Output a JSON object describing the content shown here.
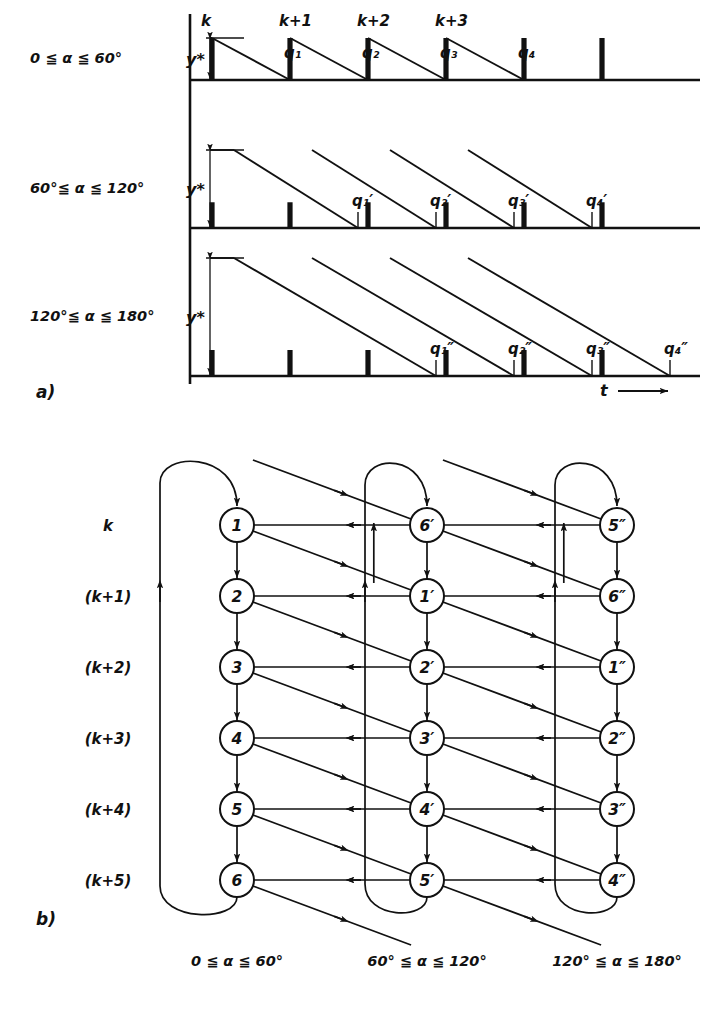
{
  "figure": {
    "panel_a_tag": "a)",
    "panel_b_tag": "b)",
    "time_axis_label": "t"
  },
  "panel_a": {
    "rows": [
      {
        "range_label": "0 ≦ α ≦ 60°",
        "amplitude_label": "y*",
        "pulse_labels": [
          "k",
          "k+1",
          "k+2",
          "k+3"
        ],
        "q_labels": [
          "q₁",
          "q₂",
          "q₃",
          "q₄"
        ],
        "ramp_span_periods": 1,
        "baseline_y": 80,
        "amplitude_px": 42
      },
      {
        "range_label": "60°≦ α ≦ 120°",
        "amplitude_label": "y*",
        "pulse_labels": [],
        "q_labels": [
          "q₁′",
          "q₂′",
          "q₃′",
          "q₄′"
        ],
        "ramp_span_periods": 2,
        "baseline_y": 228,
        "amplitude_px": 78
      },
      {
        "range_label": "120°≦ α ≦ 180°",
        "amplitude_label": "y*",
        "pulse_labels": [],
        "q_labels": [
          "q₁″",
          "q₂″",
          "q₃″",
          "q₄″"
        ],
        "ramp_span_periods": 3,
        "baseline_y": 376,
        "amplitude_px": 118
      }
    ]
  },
  "panel_b": {
    "row_labels": [
      "k",
      "(k+1)",
      "(k+2)",
      "(k+3)",
      "(k+4)",
      "(k+5)"
    ],
    "column_labels": [
      "0 ≦ α ≦ 60°",
      "60° ≦ α ≦ 120°",
      "120° ≦ α ≦ 180°"
    ],
    "columns": [
      {
        "nodes": [
          "1",
          "2",
          "3",
          "4",
          "5",
          "6"
        ]
      },
      {
        "nodes": [
          "6′",
          "1′",
          "2′",
          "3′",
          "4′",
          "5′"
        ]
      },
      {
        "nodes": [
          "5″",
          "6″",
          "1″",
          "2″",
          "3″",
          "4″"
        ]
      }
    ]
  },
  "style": {
    "ink": "#111111",
    "paper": "#ffffff"
  }
}
